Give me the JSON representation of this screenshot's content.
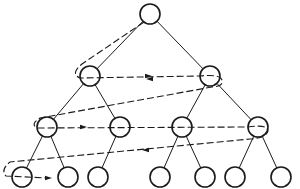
{
  "diagram": {
    "type": "binary-tree-level-order-traversal",
    "colors": {
      "background": "#ffffff",
      "stroke": "#1a1a1a"
    },
    "node_radius": 10,
    "nodes": [
      {
        "id": "n0",
        "level": 0,
        "x": 150,
        "y": 14
      },
      {
        "id": "n1",
        "level": 1,
        "x": 90,
        "y": 76
      },
      {
        "id": "n2",
        "level": 1,
        "x": 210,
        "y": 76
      },
      {
        "id": "n3",
        "level": 2,
        "x": 47,
        "y": 127
      },
      {
        "id": "n4",
        "level": 2,
        "x": 120,
        "y": 127
      },
      {
        "id": "n5",
        "level": 2,
        "x": 182,
        "y": 127
      },
      {
        "id": "n6",
        "level": 2,
        "x": 258,
        "y": 127
      },
      {
        "id": "n7",
        "level": 3,
        "x": 22,
        "y": 177
      },
      {
        "id": "n8",
        "level": 3,
        "x": 68,
        "y": 177
      },
      {
        "id": "n9",
        "level": 3,
        "x": 98,
        "y": 177
      },
      {
        "id": "n10",
        "level": 3,
        "x": 160,
        "y": 177
      },
      {
        "id": "n11",
        "level": 3,
        "x": 205,
        "y": 177
      },
      {
        "id": "n12",
        "level": 3,
        "x": 235,
        "y": 177
      },
      {
        "id": "n13",
        "level": 3,
        "x": 281,
        "y": 177
      }
    ],
    "edges": [
      [
        "n0",
        "n1"
      ],
      [
        "n0",
        "n2"
      ],
      [
        "n1",
        "n3"
      ],
      [
        "n1",
        "n4"
      ],
      [
        "n2",
        "n5"
      ],
      [
        "n2",
        "n6"
      ],
      [
        "n3",
        "n7"
      ],
      [
        "n3",
        "n8"
      ],
      [
        "n4",
        "n9"
      ],
      [
        "n5",
        "n10"
      ],
      [
        "n5",
        "n11"
      ],
      [
        "n6",
        "n12"
      ],
      [
        "n6",
        "n13"
      ]
    ],
    "traversal_path": "M144,22 L82,64 Q70,74 80,78 L200,76 Q220,74 222,80 Q224,86 212,87 L40,118 Q30,124 37,128 L248,127 Q268,124 268,131 Q266,138 250,139 L10,162 Q0,170 6,176 L48,178",
    "traversal_arrows": [
      {
        "x": 148,
        "y": 76,
        "dir": "right"
      },
      {
        "x": 150,
        "y": 79,
        "dir": "left"
      },
      {
        "x": 83,
        "y": 127,
        "dir": "right"
      },
      {
        "x": 146,
        "y": 150,
        "dir": "left"
      },
      {
        "x": 48,
        "y": 178,
        "dir": "right"
      }
    ]
  }
}
